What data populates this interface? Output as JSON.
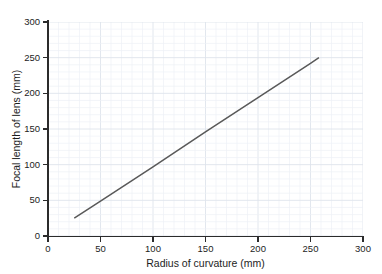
{
  "figure": {
    "background_color": "#ffffff",
    "top_artifact_text": "· ·"
  },
  "chart_data": {
    "type": "line",
    "title": "",
    "xlabel": "Radius of curvature (mm)",
    "ylabel": "Focal length of lens (mm)",
    "xlim": [
      0,
      300
    ],
    "ylim": [
      0,
      300
    ],
    "xticks": [
      0,
      50,
      100,
      150,
      200,
      250,
      300
    ],
    "yticks": [
      0,
      50,
      100,
      150,
      200,
      250,
      300
    ],
    "xticklabels": [
      "0",
      "50",
      "100",
      "150",
      "200",
      "250",
      "300"
    ],
    "yticklabels": [
      "0",
      "50",
      "100",
      "150",
      "200",
      "250",
      "300"
    ],
    "grid": true,
    "grid_minor_step": 10,
    "grid_major_step": 50,
    "grid_color": "#dfe4ec",
    "grid_minor_color": "#eef1f6",
    "axis_color": "#2b2b2b",
    "legend": false,
    "series": [
      {
        "name": "Focal length vs radius of curvature",
        "color": "#595959",
        "line_width": 1.5,
        "x": [
          25,
          258
        ],
        "y": [
          25,
          250
        ],
        "points": [
          {
            "x": 25,
            "y": 25
          },
          {
            "x": 50,
            "y": 49
          },
          {
            "x": 100,
            "y": 97
          },
          {
            "x": 150,
            "y": 146
          },
          {
            "x": 200,
            "y": 194
          },
          {
            "x": 250,
            "y": 242
          },
          {
            "x": 258,
            "y": 250
          }
        ]
      }
    ]
  }
}
